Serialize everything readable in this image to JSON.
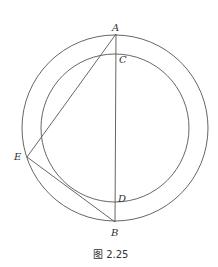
{
  "figure": {
    "caption": "图 2.25",
    "stroke_color": "#555555",
    "outer_circle": {
      "cx": 115,
      "cy": 128,
      "r": 93
    },
    "inner_circle": {
      "cx": 115,
      "cy": 128,
      "r": 74
    },
    "points": {
      "A": {
        "label": "A",
        "x": 116,
        "y": 34
      },
      "C": {
        "label": "C",
        "x": 116,
        "y": 54
      },
      "D": {
        "label": "D",
        "x": 116,
        "y": 202
      },
      "B": {
        "label": "B",
        "x": 115,
        "y": 222
      },
      "E": {
        "label": "E",
        "x": 27,
        "y": 157
      }
    },
    "segments": [
      {
        "from": "A",
        "to": "B"
      },
      {
        "from": "A",
        "to": "E"
      },
      {
        "from": "E",
        "to": "B"
      }
    ]
  }
}
